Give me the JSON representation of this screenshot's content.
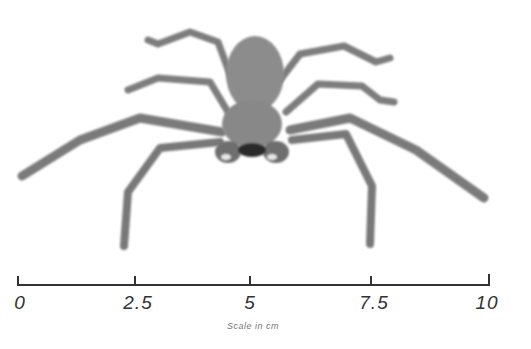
{
  "figure": {
    "colors": {
      "body": "#8a8a8a",
      "legs": "#7a7a7a",
      "dark": "#2a2a2a",
      "background": "#ffffff"
    }
  },
  "scale": {
    "ticks": [
      {
        "label": "0",
        "x": 18
      },
      {
        "label": "2.5",
        "x": 135
      },
      {
        "label": "5",
        "x": 250
      },
      {
        "label": "7.5",
        "x": 371
      },
      {
        "label": "10",
        "x": 489
      }
    ],
    "caption": "Scale in cm",
    "unit": "cm",
    "range": [
      0,
      10
    ]
  }
}
